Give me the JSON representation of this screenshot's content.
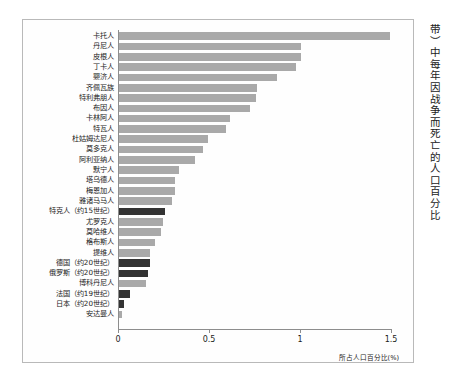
{
  "caption": {
    "side_text": "带）中每年因战争而死亡的人口百分比"
  },
  "axis": {
    "x_title": "所占人口百分比(%)",
    "x_ticks": [
      "0",
      "0.5",
      "1",
      "1.5"
    ]
  },
  "colors": {
    "bar_light": "#a9a9a9",
    "bar_dark": "#333333",
    "axis": "#8d8d8d",
    "frame": "#b9b9b9",
    "text": "#1b1b1b"
  },
  "chart_data": {
    "type": "bar",
    "orientation": "horizontal",
    "title": "",
    "xlabel": "所占人口百分比(%)",
    "ylabel": "",
    "xlim": [
      0,
      1.5
    ],
    "grid": false,
    "legend": null,
    "categories": [
      "卡托人",
      "丹尼人",
      "皮根人",
      "丁卡人",
      "婴济人",
      "齐佩瓦族",
      "特利弗朋人",
      "布因人",
      "卡林阿人",
      "特瓦人",
      "杜姑姆达尼人",
      "莫多克人",
      "阿利亚纳人",
      "默宁人",
      "塔乌德人",
      "梅恩加人",
      "雅诸马马人",
      "特克人（约15世纪）",
      "尤罗克人",
      "莫哈维人",
      "格布斯人",
      "提维人",
      "德国（约20世纪）",
      "俄罗斯（约20世纪）",
      "博科丹尼人",
      "法国（约19世纪）",
      "日本（约20世纪）",
      "安达曼人"
    ],
    "values": [
      1.49,
      1.0,
      1.0,
      0.97,
      0.87,
      0.76,
      0.75,
      0.72,
      0.61,
      0.59,
      0.49,
      0.46,
      0.42,
      0.33,
      0.31,
      0.31,
      0.29,
      0.25,
      0.24,
      0.23,
      0.2,
      0.17,
      0.17,
      0.16,
      0.15,
      0.06,
      0.03,
      0.015
    ],
    "highlight_flags": [
      false,
      false,
      false,
      false,
      false,
      false,
      false,
      false,
      false,
      false,
      false,
      false,
      false,
      false,
      false,
      false,
      false,
      true,
      false,
      false,
      false,
      false,
      true,
      true,
      false,
      true,
      true,
      false
    ]
  }
}
